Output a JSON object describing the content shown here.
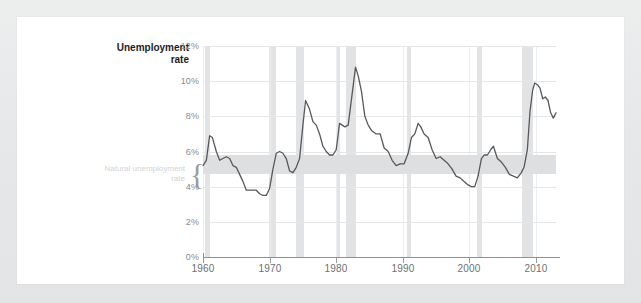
{
  "card": {
    "background_color": "#ffffff",
    "page_background_color": "#e9eaec"
  },
  "chart_data": {
    "type": "line",
    "title": "",
    "axis_title": "Unemployment rate",
    "axis_title_line1": "Unemployment",
    "axis_title_line2": "rate",
    "xlabel": "",
    "ylabel": "Unemployment rate",
    "xlim": [
      1960,
      2013
    ],
    "ylim": [
      0,
      12
    ],
    "grid": true,
    "legend_position": "none",
    "ytick_labels": [
      "0%",
      "2%",
      "4%",
      "6%",
      "8%",
      "10%",
      "12%"
    ],
    "ytick_values": [
      0,
      2,
      4,
      6,
      8,
      10,
      12
    ],
    "xtick_labels": [
      "1960",
      "1970",
      "1980",
      "1990",
      "2000",
      "2010"
    ],
    "xtick_values": [
      1960,
      1970,
      1980,
      1990,
      2000,
      2010
    ],
    "series_name": "Unemployment rate",
    "series_color": "#58585a",
    "annotations": [
      {
        "name": "natural-unemployment-rate-band",
        "label": "Natural unemployment rate",
        "label_line1": "Natural unemployment",
        "label_line2": "rate",
        "type": "hband",
        "y_low": 4.7,
        "y_high": 5.8,
        "color": "#dedfe1",
        "brace": "{"
      }
    ],
    "recession_bands": [
      {
        "start": 1960.3,
        "end": 1961.1
      },
      {
        "start": 1969.9,
        "end": 1970.9
      },
      {
        "start": 1973.9,
        "end": 1975.2
      },
      {
        "start": 1980.0,
        "end": 1980.6
      },
      {
        "start": 1981.5,
        "end": 1982.9
      },
      {
        "start": 1990.6,
        "end": 1991.2
      },
      {
        "start": 2001.2,
        "end": 2001.9
      },
      {
        "start": 2007.9,
        "end": 2009.5
      }
    ],
    "x": [
      1960.0,
      1960.5,
      1961.0,
      1961.4,
      1962.0,
      1962.5,
      1963.0,
      1963.5,
      1964.0,
      1964.5,
      1965.0,
      1965.5,
      1966.0,
      1966.5,
      1967.0,
      1967.5,
      1968.0,
      1968.5,
      1969.0,
      1969.5,
      1970.0,
      1970.5,
      1971.0,
      1971.5,
      1972.0,
      1972.5,
      1973.0,
      1973.5,
      1974.0,
      1974.5,
      1975.0,
      1975.4,
      1976.0,
      1976.5,
      1977.0,
      1977.5,
      1978.0,
      1978.5,
      1979.0,
      1979.5,
      1980.0,
      1980.5,
      1980.9,
      1981.3,
      1981.8,
      1982.3,
      1982.9,
      1983.3,
      1983.8,
      1984.3,
      1984.8,
      1985.3,
      1986.0,
      1986.6,
      1987.2,
      1987.8,
      1988.4,
      1989.0,
      1989.6,
      1990.2,
      1990.8,
      1991.3,
      1991.8,
      1992.3,
      1992.7,
      1993.2,
      1993.8,
      1994.4,
      1995.0,
      1995.6,
      1996.2,
      1996.8,
      1997.4,
      1998.0,
      1998.6,
      1999.2,
      1999.8,
      2000.3,
      2000.8,
      2001.3,
      2001.8,
      2002.2,
      2002.7,
      2003.2,
      2003.6,
      2004.2,
      2004.8,
      2005.4,
      2006.0,
      2006.6,
      2007.2,
      2007.8,
      2008.2,
      2008.7,
      2009.1,
      2009.5,
      2009.8,
      2010.2,
      2010.6,
      2011.0,
      2011.4,
      2011.8,
      2012.2,
      2012.6,
      2013.0
    ],
    "y": [
      5.2,
      5.5,
      6.9,
      6.8,
      6.0,
      5.5,
      5.6,
      5.7,
      5.6,
      5.2,
      5.1,
      4.7,
      4.3,
      3.8,
      3.8,
      3.8,
      3.8,
      3.6,
      3.5,
      3.5,
      3.9,
      5.0,
      5.9,
      6.0,
      5.9,
      5.6,
      4.9,
      4.8,
      5.1,
      5.6,
      7.5,
      8.9,
      8.4,
      7.7,
      7.5,
      7.0,
      6.3,
      6.0,
      5.8,
      5.8,
      6.1,
      7.6,
      7.5,
      7.4,
      7.5,
      9.0,
      10.8,
      10.3,
      9.4,
      8.0,
      7.5,
      7.2,
      7.0,
      7.0,
      6.2,
      6.0,
      5.5,
      5.2,
      5.3,
      5.3,
      5.9,
      6.8,
      7.0,
      7.6,
      7.4,
      7.0,
      6.8,
      6.1,
      5.6,
      5.7,
      5.5,
      5.3,
      5.0,
      4.6,
      4.5,
      4.3,
      4.1,
      4.0,
      4.0,
      4.6,
      5.6,
      5.8,
      5.8,
      6.1,
      6.3,
      5.6,
      5.4,
      5.1,
      4.7,
      4.6,
      4.5,
      4.8,
      5.1,
      6.1,
      8.3,
      9.5,
      9.9,
      9.8,
      9.6,
      9.0,
      9.1,
      8.9,
      8.2,
      7.9,
      8.2
    ]
  }
}
